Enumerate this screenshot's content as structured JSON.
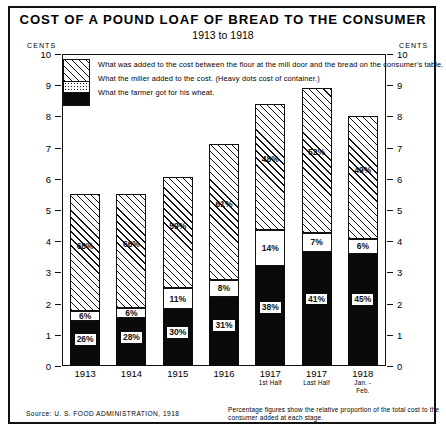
{
  "header": {
    "title": "COST OF A POUND LOAF OF BREAD TO THE CONSUMER",
    "subtitle": "1913 to 1918",
    "cents_left": "CENTS",
    "cents_right": "CENTS"
  },
  "legend": {
    "items": [
      {
        "key": "top",
        "label": "What was added to the cost between the flour at the mill door and the bread on the consumer's table."
      },
      {
        "key": "mid",
        "label": "What the miller added to the cost. (Heavy dots cost of container.)"
      },
      {
        "key": "bot",
        "label": "What the farmer got for his wheat."
      }
    ]
  },
  "footer": {
    "source": "Source: U. S. FOOD ADMINISTRATION, 1918",
    "note": "Percentage figures show the relative proportion of the total cost to the consumer added at each stage."
  },
  "chart_data": {
    "type": "bar",
    "title": "COST OF A POUND LOAF OF BREAD TO THE CONSUMER",
    "subtitle": "1913 to 1918",
    "xlabel": "",
    "ylabel": "CENTS",
    "ylim": [
      0,
      10
    ],
    "yticks": [
      0,
      1,
      2,
      3,
      4,
      5,
      6,
      7,
      8,
      9,
      10
    ],
    "ytick_labels": [
      "0",
      "1",
      "2",
      "3",
      "4",
      "5",
      "6",
      "7",
      "8",
      "9",
      "10"
    ],
    "grid": false,
    "stacked": true,
    "legend_position": "inside-top-left",
    "categories": [
      "1913",
      "1914",
      "1915",
      "1916",
      "1917",
      "1917",
      "1918"
    ],
    "category_sublabels": [
      "",
      "",
      "",
      "",
      "1st Half",
      "Last Half",
      "Jan. - Feb."
    ],
    "totals_cents": [
      5.5,
      5.5,
      6.05,
      7.1,
      8.4,
      8.9,
      8.0
    ],
    "series": [
      {
        "name": "What the farmer got for his wheat",
        "key": "bot",
        "values_cents": [
          1.43,
          1.54,
          1.82,
          2.2,
          3.19,
          3.65,
          3.6
        ],
        "percent_labels": [
          "26%",
          "28%",
          "30%",
          "31%",
          "38%",
          "41%",
          "45%"
        ]
      },
      {
        "name": "What the miller added to the cost",
        "key": "mid",
        "values_cents": [
          0.33,
          0.33,
          0.67,
          0.57,
          1.18,
          0.62,
          0.48
        ],
        "percent_labels": [
          "6%",
          "6%",
          "11%",
          "8%",
          "14%",
          "7%",
          "6%"
        ]
      },
      {
        "name": "What was added between mill door and consumer's table",
        "key": "top",
        "values_cents": [
          3.74,
          3.63,
          3.57,
          4.33,
          4.03,
          4.63,
          3.92
        ],
        "percent_labels": [
          "68%",
          "66%",
          "59%",
          "61%",
          "48%",
          "52%",
          "49%"
        ]
      }
    ]
  }
}
